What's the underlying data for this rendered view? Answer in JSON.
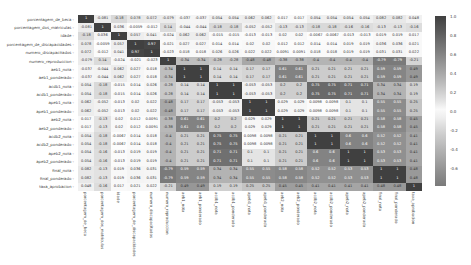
{
  "chart_data": {
    "type": "heatmap",
    "title": "",
    "labels": [
      "porcentagem_de_beca",
      "porcentagem_dos_matriculas",
      "idade",
      "porcentagem_de_discapacidades",
      "numero_discapacitados",
      "numero_reproduccion",
      "aeb1_nota",
      "aeb1_ponderado",
      "acdb1_nota",
      "acdb1_ponderado",
      "apeb1_nota",
      "apeb1_ponderado",
      "aeb2_nota",
      "aeb2_ponderado",
      "acdb2_nota",
      "acdb2_ponderado",
      "apeb2_nota",
      "apeb2_ponderado",
      "final_nota",
      "final_ponderado",
      "taxa_aprobacion"
    ],
    "matrix": [
      [
        1,
        -0.081,
        -0.18,
        0.078,
        0.072,
        -0.079,
        -0.037,
        -0.037,
        0.054,
        0.054,
        0.062,
        0.062,
        0.017,
        0.017,
        0.054,
        0.054,
        0.054,
        0.054,
        0.082,
        0.082,
        0.048
      ],
      [
        -0.081,
        1,
        0.036,
        -0.0059,
        -0.012,
        0.14,
        -0.044,
        -0.044,
        -0.18,
        -0.18,
        -0.052,
        -0.052,
        -0.13,
        -0.13,
        -0.18,
        -0.18,
        -0.16,
        -0.16,
        -0.13,
        -0.13,
        -0.16
      ],
      [
        -0.18,
        0.036,
        1,
        0.057,
        0.041,
        -0.024,
        0.062,
        0.062,
        -0.015,
        -0.015,
        -0.013,
        -0.013,
        0.02,
        0.02,
        -0.0067,
        -0.0067,
        -0.013,
        -0.013,
        0.019,
        0.019,
        0.017
      ],
      [
        0.078,
        -0.0059,
        0.057,
        1,
        0.97,
        -0.021,
        0.027,
        0.027,
        0.014,
        0.014,
        0.02,
        0.02,
        0.012,
        0.012,
        0.014,
        0.014,
        0.019,
        0.019,
        0.036,
        0.036,
        0.021
      ],
      [
        0.072,
        -0.012,
        0.041,
        0.97,
        1,
        -0.023,
        0.018,
        0.018,
        0.026,
        0.026,
        0.022,
        0.022,
        0.0091,
        0.0091,
        0.018,
        0.018,
        0.019,
        0.019,
        0.031,
        0.031,
        0.022
      ],
      [
        -0.079,
        0.14,
        -0.024,
        -0.021,
        -0.023,
        1,
        -0.34,
        -0.34,
        -0.28,
        -0.28,
        -0.48,
        -0.48,
        -0.38,
        -0.38,
        -0.4,
        -0.4,
        -0.4,
        -0.4,
        -0.79,
        -0.79,
        -0.21
      ],
      [
        -0.037,
        -0.044,
        0.062,
        0.027,
        0.018,
        -0.34,
        1,
        1,
        0.14,
        0.14,
        0.17,
        0.17,
        0.61,
        0.61,
        0.21,
        0.21,
        0.21,
        0.21,
        0.59,
        0.59,
        0.49
      ],
      [
        -0.037,
        -0.044,
        0.062,
        0.027,
        0.018,
        -0.34,
        1,
        1,
        0.14,
        0.14,
        0.17,
        0.17,
        0.61,
        0.61,
        0.21,
        0.21,
        0.21,
        0.21,
        0.59,
        0.59,
        0.49
      ],
      [
        0.054,
        -0.18,
        -0.015,
        0.014,
        0.026,
        -0.28,
        0.14,
        0.14,
        1,
        1,
        -0.053,
        -0.053,
        0.2,
        0.2,
        0.75,
        0.75,
        0.71,
        0.71,
        0.34,
        0.34,
        0.19
      ],
      [
        0.054,
        -0.18,
        -0.015,
        0.014,
        0.026,
        -0.28,
        0.14,
        0.14,
        1,
        1,
        -0.053,
        -0.053,
        0.2,
        0.2,
        0.75,
        0.75,
        0.71,
        0.71,
        0.34,
        0.34,
        0.19
      ],
      [
        0.062,
        -0.052,
        -0.013,
        0.02,
        0.022,
        -0.48,
        0.17,
        0.17,
        -0.053,
        -0.053,
        1,
        1,
        0.029,
        0.029,
        0.0098,
        0.0098,
        0.1,
        0.1,
        0.55,
        0.55,
        0.25
      ],
      [
        0.062,
        -0.052,
        -0.013,
        0.02,
        0.022,
        -0.48,
        0.17,
        0.17,
        -0.053,
        -0.053,
        1,
        1,
        0.029,
        0.029,
        0.0098,
        0.0098,
        0.1,
        0.1,
        0.55,
        0.55,
        0.25
      ],
      [
        0.017,
        -0.13,
        0.02,
        0.012,
        0.0091,
        -0.38,
        0.61,
        0.61,
        0.2,
        0.2,
        0.029,
        0.029,
        1,
        1,
        0.21,
        0.21,
        0.21,
        0.21,
        0.58,
        0.58,
        0.45
      ],
      [
        0.017,
        -0.13,
        0.02,
        0.012,
        0.0091,
        -0.38,
        0.61,
        0.61,
        0.2,
        0.2,
        0.029,
        0.029,
        1,
        1,
        0.21,
        0.21,
        0.21,
        0.21,
        0.58,
        0.58,
        0.45
      ],
      [
        0.054,
        -0.18,
        -0.0067,
        0.014,
        0.018,
        -0.4,
        0.21,
        0.21,
        0.75,
        0.75,
        0.0098,
        0.0098,
        0.21,
        0.21,
        1,
        1,
        0.6,
        0.6,
        0.52,
        0.52,
        0.41
      ],
      [
        0.054,
        -0.18,
        -0.0067,
        0.014,
        0.018,
        -0.4,
        0.21,
        0.21,
        0.75,
        0.75,
        0.0098,
        0.0098,
        0.21,
        0.21,
        1,
        1,
        0.6,
        0.6,
        0.52,
        0.52,
        0.41
      ],
      [
        0.054,
        -0.16,
        -0.013,
        0.019,
        0.019,
        -0.4,
        0.21,
        0.21,
        0.71,
        0.71,
        0.1,
        0.1,
        0.21,
        0.21,
        0.6,
        0.6,
        1,
        1,
        0.53,
        0.53,
        0.41
      ],
      [
        0.054,
        -0.16,
        -0.013,
        0.019,
        0.019,
        -0.4,
        0.21,
        0.21,
        0.71,
        0.71,
        0.1,
        0.1,
        0.21,
        0.21,
        0.6,
        0.6,
        1,
        1,
        0.53,
        0.53,
        0.41
      ],
      [
        0.082,
        -0.13,
        0.019,
        0.036,
        0.031,
        -0.79,
        0.59,
        0.59,
        0.34,
        0.34,
        0.55,
        0.55,
        0.58,
        0.58,
        0.52,
        0.52,
        0.53,
        0.53,
        1,
        1,
        0.48
      ],
      [
        0.082,
        -0.13,
        0.019,
        0.036,
        0.031,
        -0.79,
        0.59,
        0.59,
        0.34,
        0.34,
        0.55,
        0.55,
        0.58,
        0.58,
        0.52,
        0.52,
        0.53,
        0.53,
        1,
        1,
        0.48
      ],
      [
        0.048,
        -0.16,
        0.017,
        0.021,
        0.022,
        -0.21,
        0.49,
        0.49,
        0.19,
        0.19,
        0.25,
        0.25,
        0.45,
        0.45,
        0.41,
        0.41,
        0.41,
        0.41,
        0.48,
        0.48,
        1
      ]
    ],
    "colorbar": {
      "ticks": [
        "1.0",
        "0.8",
        "0.6",
        "0.4",
        "0.2",
        "0.0",
        "-0.2",
        "-0.4",
        "-0.6"
      ],
      "tick_values": [
        1.0,
        0.8,
        0.6,
        0.4,
        0.2,
        0.0,
        -0.2,
        -0.4,
        -0.6
      ],
      "range": [
        -0.79,
        1.0
      ],
      "colors": {
        "high": "#404040",
        "mid": "#ffffff",
        "low": "#7a7a7a"
      }
    },
    "annotations": true,
    "xlabel": "",
    "ylabel": ""
  }
}
